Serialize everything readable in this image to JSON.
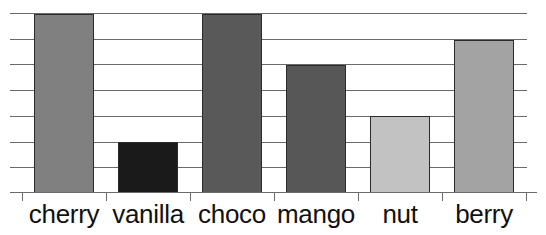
{
  "chart_data": {
    "type": "bar",
    "title": "",
    "subtitle": "",
    "xlabel": "",
    "ylabel": "",
    "categories": [
      "cherry",
      "vanilla",
      "choco",
      "mango",
      "nut",
      "berry"
    ],
    "values": [
      7,
      2,
      7,
      5,
      3,
      6
    ],
    "ylim": [
      0,
      7
    ],
    "xlim": [
      0,
      6
    ],
    "grid": true,
    "gridlines": [
      0,
      1,
      2,
      3,
      4,
      5,
      6,
      7
    ],
    "legend": "none",
    "legend_position": "none",
    "bar_colors": [
      "#808080",
      "#1a1a1a",
      "#595959",
      "#575757",
      "#c2c2c2",
      "#a3a3a3"
    ],
    "bar_edge_color": "#2b2b2b",
    "grid_color": "#6b6b6b",
    "axis_color": "#6b6b6b",
    "background": "#ffffff",
    "tick_labels_x": [
      "cherry",
      "vanilla",
      "choco",
      "mango",
      "nut",
      "berry"
    ],
    "tick_labels_y": []
  }
}
